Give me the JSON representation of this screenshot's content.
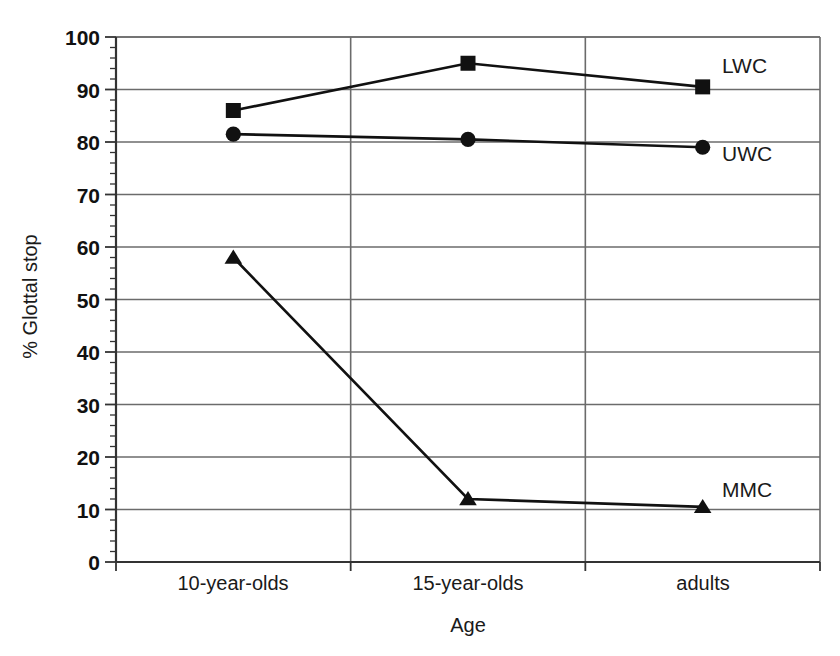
{
  "chart_data": {
    "type": "line",
    "title": "",
    "subtitle": "",
    "xlabel": "Age",
    "ylabel": "% Glottal stop",
    "categories": [
      "10-year-olds",
      "15-year-olds",
      "adults"
    ],
    "series": [
      {
        "name": "LWC",
        "marker": "square",
        "values": [
          86,
          95,
          90.5
        ]
      },
      {
        "name": "UWC",
        "marker": "circle",
        "values": [
          81.5,
          80.5,
          79
        ]
      },
      {
        "name": "MMC",
        "marker": "triangle",
        "values": [
          58,
          12,
          10.5
        ]
      }
    ],
    "ylim": [
      0,
      100
    ],
    "ytick_labels": [
      "0",
      "10",
      "20",
      "30",
      "40",
      "50",
      "60",
      "70",
      "80",
      "90",
      "100"
    ],
    "ytick_values": [
      0,
      10,
      20,
      30,
      40,
      50,
      60,
      70,
      80,
      90,
      100
    ],
    "yminor_step": 2,
    "grid": {
      "horizontal": true,
      "vertical": true
    },
    "legend_position": "inline-right",
    "colors": {
      "line": "#111111",
      "marker": "#111111",
      "grid": "#6b6b6b",
      "axis": "#333333",
      "background": "#ffffff",
      "text": "#1a1a1a"
    }
  },
  "axis": {
    "y_title": "% Glottal stop",
    "x_title": "Age",
    "y_ticks": [
      {
        "label": "100",
        "value": 100
      },
      {
        "label": "90",
        "value": 90
      },
      {
        "label": "80",
        "value": 80
      },
      {
        "label": "70",
        "value": 70
      },
      {
        "label": "60",
        "value": 60
      },
      {
        "label": "50",
        "value": 50
      },
      {
        "label": "40",
        "value": 40
      },
      {
        "label": "30",
        "value": 30
      },
      {
        "label": "20",
        "value": 20
      },
      {
        "label": "10",
        "value": 10
      },
      {
        "label": "0",
        "value": 0
      }
    ],
    "x_ticks": [
      {
        "label": "10-year-olds"
      },
      {
        "label": "15-year-olds"
      },
      {
        "label": "adults"
      }
    ]
  },
  "series_labels": [
    {
      "text": "LWC"
    },
    {
      "text": "UWC"
    },
    {
      "text": "MMC"
    }
  ]
}
